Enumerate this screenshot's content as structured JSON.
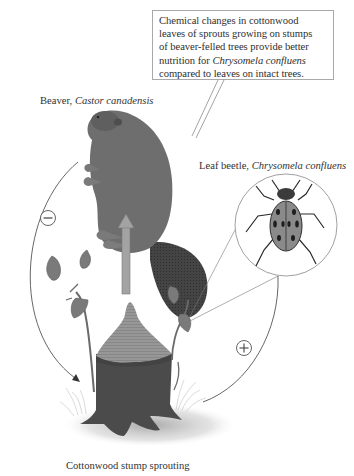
{
  "callout": {
    "line1": "Chemical changes in cottonwood",
    "line2": "leaves of sprouts growing on stumps",
    "line3": "of beaver-felled trees provide better",
    "line4_prefix": "nutrition for ",
    "line4_italic": "Chrysomela confluens",
    "line5": "compared to leaves on intact trees."
  },
  "labels": {
    "beaver_common": "Beaver, ",
    "beaver_scientific": "Castor canadensis",
    "beetle_common": "Leaf beetle, ",
    "beetle_scientific": "Chrysomela confluens",
    "stump": "Cottonwood stump sprouting"
  },
  "interactions": {
    "beaver_to_stump": "−",
    "beetle_from_stump": "+",
    "negative_symbol_name": "minus-circle",
    "positive_symbol_name": "plus-circle"
  },
  "colors": {
    "text": "#2f2f2f",
    "callout_border": "#a9a9a9",
    "beaver_fur": "#6e6e6e",
    "beaver_tail": "#3c3c3c",
    "arrow_fill": "#a3a3a3",
    "stump_top": "#8f8f8f",
    "stump_bark": "#4b4b4b",
    "leaf": "#7a7a7a",
    "cycle_line": "#555555"
  }
}
